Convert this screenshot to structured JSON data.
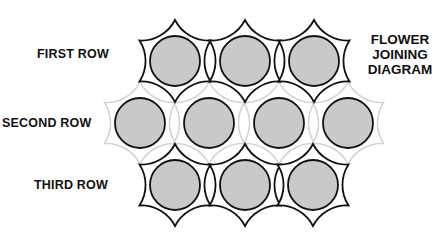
{
  "title": {
    "lines": [
      "FLOWER",
      "JOINING",
      "DIAGRAM"
    ]
  },
  "rows": [
    {
      "label": "FIRST ROW",
      "style": "dark",
      "cy": 61,
      "centers": [
        175,
        245,
        314
      ]
    },
    {
      "label": "SECOND ROW",
      "style": "light",
      "cy": 123,
      "centers": [
        140,
        209,
        279,
        348
      ]
    },
    {
      "label": "THIRD ROW",
      "style": "dark",
      "cy": 185,
      "centers": [
        175,
        245,
        313
      ]
    }
  ],
  "colors": {
    "dark_outline": "#111111",
    "light_outline": "#d4d4d4",
    "circle_fill": "#c9c9c9",
    "circle_stroke": "#111111",
    "star_fill": "#ffffff"
  },
  "geometry": {
    "star_radius": 41,
    "circle_radius": 25
  }
}
